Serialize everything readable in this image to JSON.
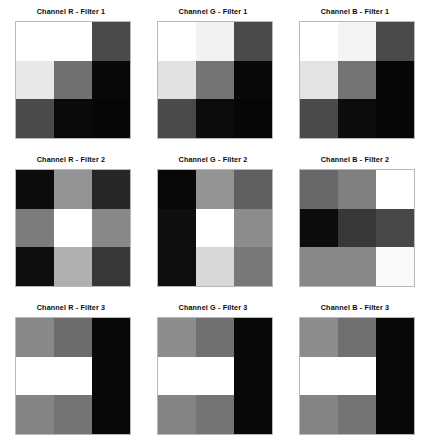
{
  "figure": {
    "background": "#ffffff",
    "rows": 3,
    "cols": 3,
    "width": 427,
    "height": 444
  },
  "chart_data": {
    "type": "heatmap",
    "title": "",
    "xlabel": "",
    "ylabel": "",
    "grid": false,
    "legend": "none",
    "colormap": "gray",
    "vmin": 0,
    "vmax": 255,
    "layout": {
      "nrows": 3,
      "ncols": 3,
      "panel_width": 142,
      "panel_height": 148,
      "cells_per_panel": "3x3"
    },
    "panels": [
      {
        "title": "Channel R - Filter 1",
        "channel": "R",
        "filter": 1,
        "matrix": [
          [
            255,
            255,
            74
          ],
          [
            232,
            112,
            8
          ],
          [
            74,
            10,
            6
          ]
        ],
        "colors": [
          [
            "#ffffff",
            "#ffffff",
            "#4a4a4a"
          ],
          [
            "#e8e8e8",
            "#707070",
            "#080808"
          ],
          [
            "#4a4a4a",
            "#0a0a0a",
            "#060606"
          ]
        ]
      },
      {
        "title": "Channel G - Filter 1",
        "channel": "G",
        "filter": 1,
        "matrix": [
          [
            255,
            242,
            74
          ],
          [
            226,
            116,
            8
          ],
          [
            74,
            12,
            6
          ]
        ],
        "colors": [
          [
            "#ffffff",
            "#f2f2f2",
            "#4a4a4a"
          ],
          [
            "#e2e2e2",
            "#747474",
            "#080808"
          ],
          [
            "#4a4a4a",
            "#0c0c0c",
            "#060606"
          ]
        ]
      },
      {
        "title": "Channel B - Filter 1",
        "channel": "B",
        "filter": 1,
        "matrix": [
          [
            255,
            244,
            74
          ],
          [
            228,
            116,
            6
          ],
          [
            74,
            12,
            6
          ]
        ],
        "colors": [
          [
            "#ffffff",
            "#f4f4f4",
            "#4a4a4a"
          ],
          [
            "#e4e4e4",
            "#747474",
            "#060606"
          ],
          [
            "#4a4a4a",
            "#0c0c0c",
            "#060606"
          ]
        ]
      },
      {
        "title": "Channel R - Filter 2",
        "channel": "R",
        "filter": 2,
        "matrix": [
          [
            12,
            148,
            38
          ],
          [
            124,
            255,
            136
          ],
          [
            14,
            176,
            56
          ]
        ],
        "colors": [
          [
            "#0c0c0c",
            "#949494",
            "#262626"
          ],
          [
            "#7c7c7c",
            "#ffffff",
            "#888888"
          ],
          [
            "#0e0e0e",
            "#b0b0b0",
            "#383838"
          ]
        ]
      },
      {
        "title": "Channel G - Filter 2",
        "channel": "G",
        "filter": 2,
        "matrix": [
          [
            8,
            148,
            96
          ],
          [
            14,
            255,
            140
          ],
          [
            14,
            216,
            120
          ]
        ],
        "colors": [
          [
            "#080808",
            "#949494",
            "#606060"
          ],
          [
            "#0e0e0e",
            "#ffffff",
            "#8c8c8c"
          ],
          [
            "#0e0e0e",
            "#d8d8d8",
            "#787878"
          ]
        ]
      },
      {
        "title": "Channel B - Filter 2",
        "channel": "B",
        "filter": 2,
        "matrix": [
          [
            104,
            128,
            255
          ],
          [
            12,
            56,
            72
          ],
          [
            136,
            136,
            250
          ]
        ],
        "colors": [
          [
            "#686868",
            "#808080",
            "#ffffff"
          ],
          [
            "#0c0c0c",
            "#383838",
            "#484848"
          ],
          [
            "#888888",
            "#888888",
            "#fafafa"
          ]
        ]
      },
      {
        "title": "Channel R - Filter 3",
        "channel": "R",
        "filter": 3,
        "matrix": [
          [
            136,
            108,
            8
          ],
          [
            255,
            255,
            8
          ],
          [
            132,
            116,
            8
          ]
        ],
        "colors": [
          [
            "#888888",
            "#6c6c6c",
            "#080808"
          ],
          [
            "#ffffff",
            "#ffffff",
            "#080808"
          ],
          [
            "#848484",
            "#747474",
            "#080808"
          ]
        ]
      },
      {
        "title": "Channel G - Filter 3",
        "channel": "G",
        "filter": 3,
        "matrix": [
          [
            140,
            112,
            8
          ],
          [
            255,
            255,
            8
          ],
          [
            132,
            116,
            8
          ]
        ],
        "colors": [
          [
            "#8c8c8c",
            "#707070",
            "#080808"
          ],
          [
            "#ffffff",
            "#ffffff",
            "#080808"
          ],
          [
            "#848484",
            "#747474",
            "#080808"
          ]
        ]
      },
      {
        "title": "Channel B - Filter 3",
        "channel": "B",
        "filter": 3,
        "matrix": [
          [
            140,
            112,
            8
          ],
          [
            255,
            255,
            8
          ],
          [
            132,
            116,
            8
          ]
        ],
        "colors": [
          [
            "#8c8c8c",
            "#707070",
            "#080808"
          ],
          [
            "#ffffff",
            "#ffffff",
            "#080808"
          ],
          [
            "#848484",
            "#747474",
            "#080808"
          ]
        ]
      }
    ]
  }
}
